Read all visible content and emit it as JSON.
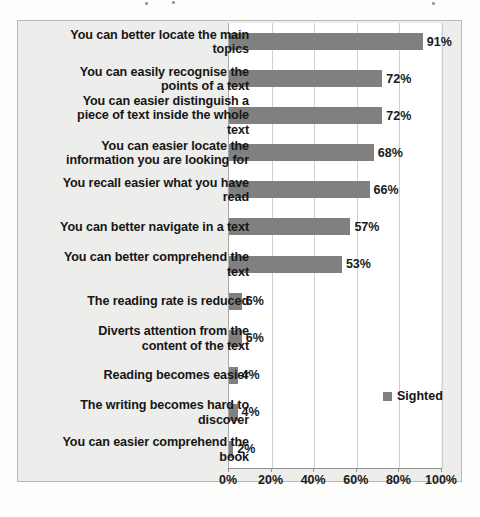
{
  "chart_data": {
    "type": "bar",
    "orientation": "horizontal",
    "title": "",
    "xlabel": "",
    "ylabel": "",
    "xlim": [
      0,
      100
    ],
    "grid": true,
    "legend_position": "inside-right",
    "series_name": "Sighted",
    "bar_color": "#808080",
    "categories": [
      "You can better locate the main topics",
      "You can easily recognise the points of a text",
      "You can easier distinguish a piece of text inside the whole text",
      "You can easier locate the information you are looking for",
      "You recall easier what you have read",
      "You can better navigate in a text",
      "You can better comprehend the text",
      "The reading rate is reduced",
      "Diverts attention from the content of the text",
      "Reading becomes easier",
      "The writing becomes hard to discover",
      "You can easier comprehend the book"
    ],
    "values": [
      91,
      72,
      72,
      68,
      66,
      57,
      53,
      6,
      6,
      4,
      4,
      2
    ],
    "value_labels": [
      "91%",
      "72%",
      "72%",
      "68%",
      "66%",
      "57%",
      "53%",
      "6%",
      "6%",
      "4%",
      "4%",
      "2%"
    ],
    "xticks": [
      0,
      20,
      40,
      60,
      80,
      100
    ],
    "xtick_labels": [
      "0%",
      "20%",
      "40%",
      "60%",
      "80%",
      "100%"
    ]
  },
  "legend": {
    "entries": [
      {
        "label": "Sighted",
        "color": "#808080"
      }
    ]
  }
}
